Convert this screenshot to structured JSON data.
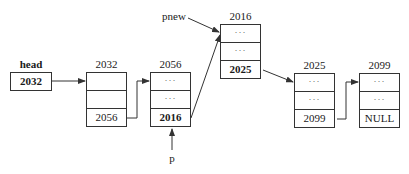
{
  "head": {
    "label": "head",
    "value": "2032"
  },
  "pointers": {
    "pnew": "pnew",
    "p": "p"
  },
  "nodes": [
    {
      "address": "2032",
      "cells": [
        "",
        "",
        "2056"
      ],
      "bold_last": false
    },
    {
      "address": "2056",
      "cells": [
        "···",
        "···",
        "2016"
      ],
      "bold_last": true
    },
    {
      "address": "2016",
      "cells": [
        "···",
        "···",
        "2025"
      ],
      "bold_last": true
    },
    {
      "address": "2025",
      "cells": [
        "···",
        "···",
        "2099"
      ],
      "bold_last": false
    },
    {
      "address": "2099",
      "cells": [
        "···",
        "···",
        "NULL"
      ],
      "bold_last": false
    }
  ],
  "colors": {
    "line": "#333333",
    "text": "#1a1a1a",
    "background": "#ffffff"
  }
}
